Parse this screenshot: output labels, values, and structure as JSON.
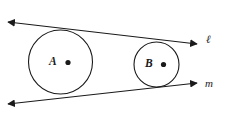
{
  "figure": {
    "background_color": "#ffffff",
    "stroke_color": "#1a1a1a"
  },
  "circles": [
    {
      "id": "circle-a",
      "label": "A",
      "center_x": 60.5,
      "center_y": 62,
      "radius": 32,
      "center_dot_x": 68,
      "center_dot_y": 62.5,
      "center_dot_radius": 2.6
    },
    {
      "id": "circle-b",
      "label": "B",
      "center_x": 156.5,
      "center_y": 64.5,
      "radius": 22.5,
      "center_dot_x": 163.5,
      "center_dot_y": 64.5,
      "center_dot_radius": 2.6
    }
  ],
  "lines": [
    {
      "id": "line-l",
      "label": "ℓ",
      "role": "upper common external tangent",
      "x1": 8,
      "y1": 22,
      "x2": 197,
      "y2": 44,
      "arrow_start": true,
      "arrow_end": true
    },
    {
      "id": "line-m",
      "label": "m",
      "role": "lower common external tangent",
      "x1": 8,
      "y1": 104,
      "x2": 197,
      "y2": 83,
      "arrow_start": true,
      "arrow_end": true
    }
  ]
}
